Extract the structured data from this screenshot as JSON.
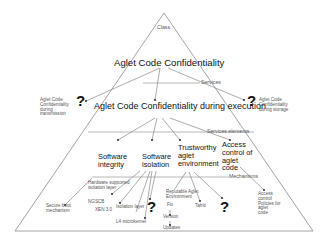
{
  "diagram": {
    "levels": {
      "class": "Class",
      "services": "Services",
      "services_elements": "Services elements",
      "mechanisms": "Mechanisms"
    },
    "class_node": "Aglet Code Confidentiality",
    "services": {
      "left": "Aglet Code Confidentiality during transmission",
      "center": "Aglet Code Confidentiality during execution",
      "right": "Aglet Code Confidentiality during storage",
      "left_marker": "?",
      "right_marker": "?"
    },
    "service_elements": [
      {
        "label_lines": [
          "Software",
          "integrity"
        ]
      },
      {
        "label_lines": [
          "Software",
          "isolation"
        ]
      },
      {
        "label_lines": [
          "Trustworthy",
          "aglet",
          "environment"
        ]
      },
      {
        "label_lines": [
          "Access",
          "control of",
          "aglet",
          "code"
        ]
      }
    ],
    "mechanisms": {
      "secure_boot": [
        "Secure boot",
        "mechanism"
      ],
      "hw_isolation": [
        "Hardware supported",
        "isolation layer"
      ],
      "ngscb": "NGSCB",
      "xen": "XEN 3.0",
      "isolation_layer": "Isolation layer",
      "l4_microkernel": "L4 microkernel",
      "isolation_marker": "?",
      "reputable_env": [
        "Reputable Aglet",
        "Environment"
      ],
      "fix": "Fix",
      "version": "Version",
      "updates": "Updates",
      "tahiti": "Tahiti",
      "env_marker": "?",
      "access_policies": [
        "Access",
        "control",
        "Policies for",
        "aglet",
        "code"
      ]
    }
  }
}
